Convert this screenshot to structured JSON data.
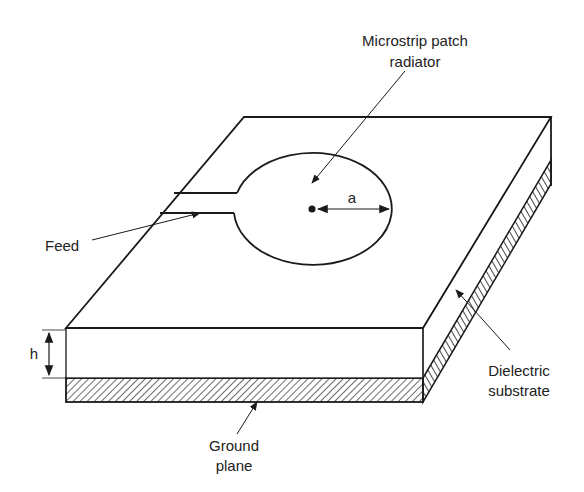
{
  "diagram": {
    "type": "microstrip-patch-antenna",
    "labels": {
      "patch_line1": "Microstrip patch",
      "patch_line2": "radiator",
      "radius": "a",
      "feed": "Feed",
      "height": "h",
      "dielectric_line1": "Dielectric",
      "dielectric_line2": "substrate",
      "ground_line1": "Ground",
      "ground_line2": "plane"
    },
    "colors": {
      "line": "#1a1a1a",
      "background": "#ffffff"
    }
  }
}
